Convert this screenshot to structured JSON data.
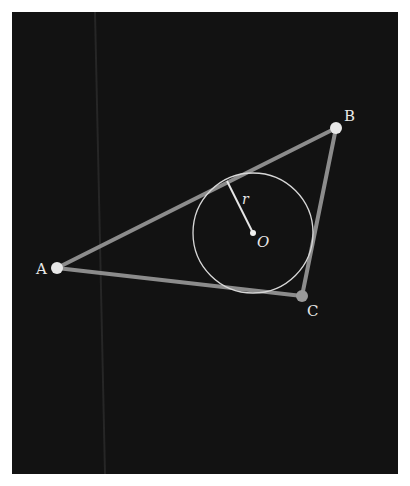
{
  "diagram": {
    "colors": {
      "page_bg": "#ffffff",
      "panel_bg": "#121212",
      "streak": "#2a2a2a",
      "triangle_stroke": "#8c8c8c",
      "vertex_fill": "#e8e8e8",
      "vertex_c_fill": "#9a9a9a",
      "circle_stroke": "#d8d8d8",
      "radius_stroke": "#e6e6e6",
      "label": "#e8e8e8"
    },
    "panel": {
      "x": 12,
      "y": 12,
      "width": 386,
      "height": 462
    },
    "vertices": [
      {
        "id": "A",
        "label": "A",
        "x": 57,
        "y": 268,
        "label_x": 36,
        "label_y": 274
      },
      {
        "id": "B",
        "label": "B",
        "x": 336,
        "y": 128,
        "label_x": 344,
        "label_y": 121
      },
      {
        "id": "C",
        "label": "C",
        "x": 302,
        "y": 296,
        "label_x": 307,
        "label_y": 316
      }
    ],
    "incircle": {
      "center_label": "O",
      "cx": 253,
      "cy": 233,
      "r": 60,
      "center_label_x": 257,
      "center_label_y": 247
    },
    "radius": {
      "label": "r",
      "x1": 253,
      "y1": 233,
      "x2": 227,
      "y2": 181,
      "label_x": 242,
      "label_y": 204
    }
  }
}
